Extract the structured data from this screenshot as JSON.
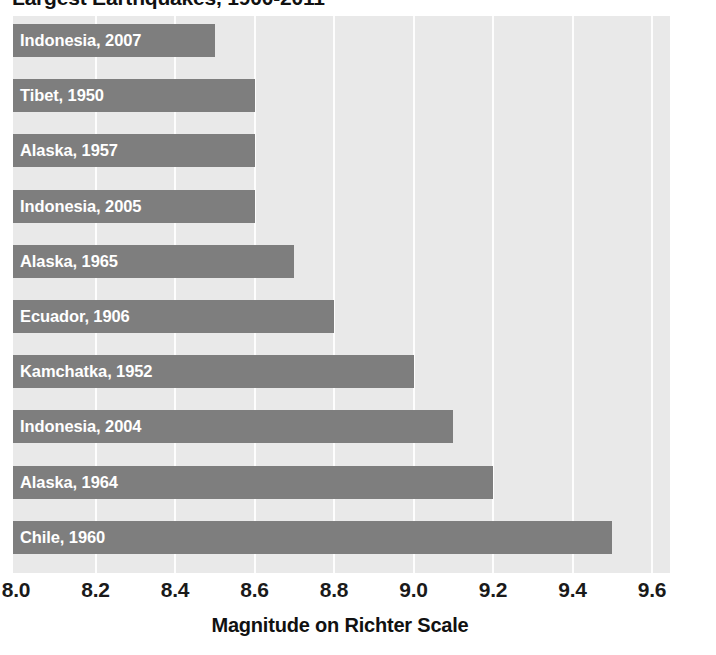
{
  "chart_data": {
    "type": "bar",
    "orientation": "horizontal",
    "title": "Largest Earthquakes, 1900-2011",
    "xlabel": "Magnitude on Richter Scale",
    "ylabel": "",
    "xlim": [
      8.0,
      9.6
    ],
    "xticks": [
      "8.0",
      "8.2",
      "8.4",
      "8.6",
      "8.8",
      "9.0",
      "9.2",
      "9.4",
      "9.6"
    ],
    "xtick_values": [
      8.0,
      8.2,
      8.4,
      8.6,
      8.8,
      9.0,
      9.2,
      9.4,
      9.6
    ],
    "grid": "vertical-white-gridlines",
    "legend": "none",
    "categories": [
      "Indonesia, 2007",
      "Tibet, 1950",
      "Alaska, 1957",
      "Indonesia, 2005",
      "Alaska, 1965",
      "Ecuador, 1906",
      "Kamchatka, 1952",
      "Indonesia, 2004",
      "Alaska, 1964",
      "Chile, 1960"
    ],
    "values": [
      8.5,
      8.6,
      8.6,
      8.6,
      8.7,
      8.8,
      9.0,
      9.1,
      9.2,
      9.5
    ],
    "bars": [
      {
        "label": "Indonesia, 2007",
        "value": 8.5
      },
      {
        "label": "Tibet, 1950",
        "value": 8.6
      },
      {
        "label": "Alaska, 1957",
        "value": 8.6
      },
      {
        "label": "Indonesia, 2005",
        "value": 8.6
      },
      {
        "label": "Alaska, 1965",
        "value": 8.7
      },
      {
        "label": "Ecuador, 1906",
        "value": 8.8
      },
      {
        "label": "Kamchatka, 1952",
        "value": 9.0
      },
      {
        "label": "Indonesia, 2004",
        "value": 9.1
      },
      {
        "label": "Alaska, 1964",
        "value": 9.2
      },
      {
        "label": "Chile, 1960",
        "value": 9.5
      }
    ],
    "source": "Source: U.S. Geological Survey.",
    "colors": {
      "bar": "#7e7e7e",
      "bar_label": "#ffffff",
      "plot_background": "#e9e9e9",
      "gridline": "#fdfdfd",
      "page_background": "#ffffff",
      "text": "#111111"
    }
  }
}
